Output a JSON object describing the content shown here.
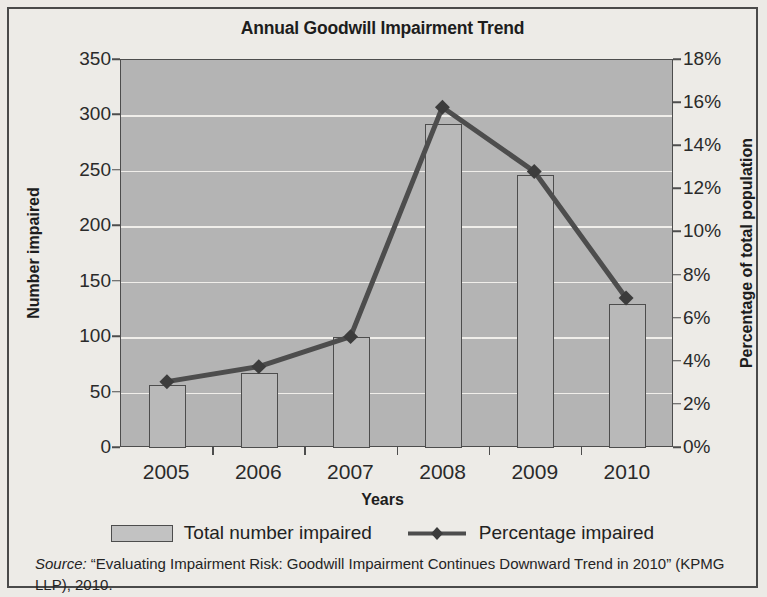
{
  "chart_data": {
    "type": "bar",
    "title": "Annual Goodwill Impairment Trend",
    "xlabel": "Years",
    "ylabel": "Number impaired",
    "y2label": "Percentage of total population",
    "categories": [
      "2005",
      "2006",
      "2007",
      "2008",
      "2009",
      "2010"
    ],
    "grid": true,
    "legend_position": "bottom",
    "ylim": [
      0,
      350
    ],
    "ytick_step": 50,
    "yticks": [
      "0",
      "50",
      "100",
      "150",
      "200",
      "250",
      "300",
      "350"
    ],
    "y2lim": [
      0,
      18
    ],
    "y2tick_step": 2,
    "y2ticks": [
      "0%",
      "2%",
      "4%",
      "6%",
      "8%",
      "10%",
      "12%",
      "14%",
      "16%",
      "18%"
    ],
    "series": [
      {
        "name": "Total number impaired",
        "type": "bar",
        "axis": "left",
        "color": "#b9b9b9",
        "values": [
          57,
          68,
          100,
          292,
          246,
          130
        ]
      },
      {
        "name": "Percentage impaired",
        "type": "line",
        "axis": "right",
        "color": "#4d4d4d",
        "marker": "diamond",
        "values": [
          3.0,
          3.7,
          5.1,
          15.8,
          12.8,
          6.9
        ]
      }
    ]
  },
  "legend": {
    "items": [
      {
        "label": "Total number impaired",
        "kind": "swatch"
      },
      {
        "label": "Percentage impaired",
        "kind": "line-marker"
      }
    ]
  },
  "source": {
    "label": "Source:",
    "text": " “Evaluating Impairment Risk: Goodwill Impairment Continues Downward Trend in 2010” (KPMG LLP), 2010."
  }
}
